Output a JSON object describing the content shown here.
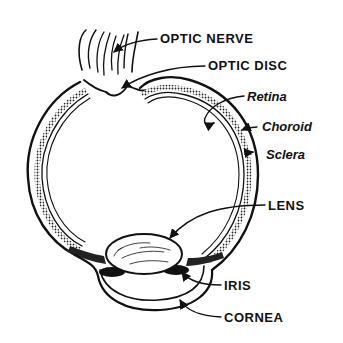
{
  "diagram": {
    "ink_color": "#111111",
    "background": "#ffffff",
    "labels": [
      {
        "id": "optic_nerve",
        "text": "OPTIC NERVE",
        "style": "caps"
      },
      {
        "id": "optic_disc",
        "text": "OPTIC DISC",
        "style": "caps"
      },
      {
        "id": "retina",
        "text": "Retina",
        "style": "italic"
      },
      {
        "id": "choroid",
        "text": "Choroid",
        "style": "italic"
      },
      {
        "id": "sclera",
        "text": "Sclera",
        "style": "italic"
      },
      {
        "id": "lens",
        "text": "LENS",
        "style": "caps"
      },
      {
        "id": "iris",
        "text": "IRIS",
        "style": "caps"
      },
      {
        "id": "cornea",
        "text": "CORNEA",
        "style": "caps"
      }
    ]
  }
}
